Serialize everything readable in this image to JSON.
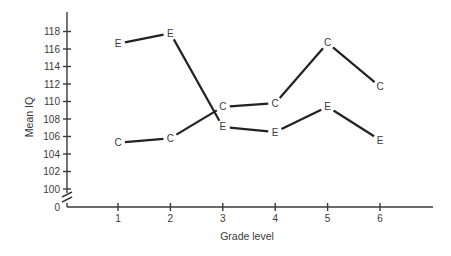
{
  "chart_data": {
    "type": "line",
    "title": "",
    "xlabel": "Grade level",
    "ylabel": "Mean IQ",
    "x": [
      1,
      2,
      3,
      4,
      5,
      6
    ],
    "categories": [
      "1",
      "2",
      "3",
      "4",
      "5",
      "6"
    ],
    "y_ticks": [
      0,
      100,
      102,
      104,
      106,
      108,
      110,
      112,
      114,
      116,
      118
    ],
    "y_tick_labels": [
      "0",
      "100",
      "102",
      "104",
      "106",
      "108",
      "110",
      "112",
      "114",
      "116",
      "118"
    ],
    "ylim": [
      100,
      119
    ],
    "y_axis_break": "between 0 and 100",
    "grid": false,
    "legend": "none (series identified by point markers 'E' and 'C')",
    "series": [
      {
        "name": "E",
        "marker": "E",
        "values": [
          116.6,
          117.8,
          107.1,
          106.5,
          109.4,
          105.6
        ]
      },
      {
        "name": "C",
        "marker": "C",
        "values": [
          105.3,
          105.8,
          109.4,
          109.8,
          116.7,
          111.7
        ]
      }
    ]
  },
  "labels": {
    "x_title": "Grade level",
    "y_title": "Mean IQ"
  }
}
